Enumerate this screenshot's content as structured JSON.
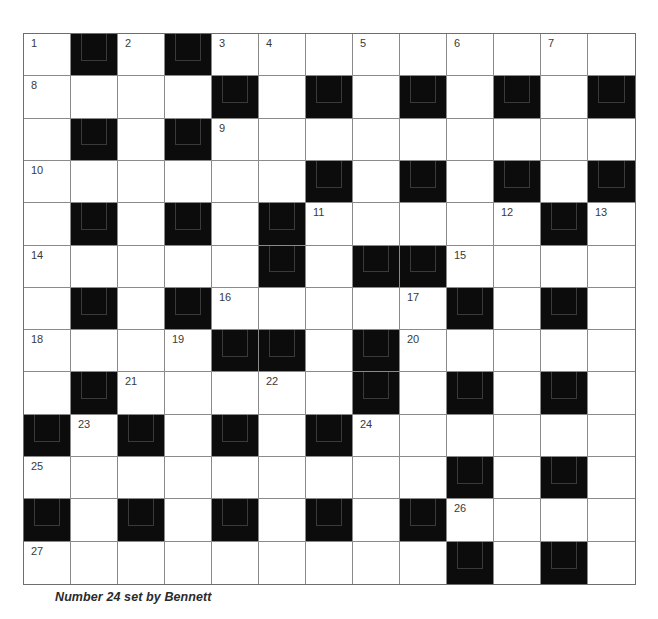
{
  "puzzle": {
    "caption": "Number 24 set by Bennett",
    "rows": 13,
    "cols": 13,
    "colors": {
      "block": "#0c0c0c",
      "cell": "#ffffff",
      "gridline": "#8a8a8a",
      "number": "#3a3a3a"
    },
    "layout": [
      "W.W.WWWWWWWWW",
      "WWWW.W.W.W.W.",
      "W.W.WWWWWWWWW",
      "WWWWWW.W.W.W.",
      "W.W.W.WWWWW.W",
      "WWWWW.W..WWWW",
      "W.W.WWWWW.W.W",
      "WWWW..W.WWWWW",
      "W.WWWWW.W.W.W",
      ".W.W.W.WWWWWW",
      "WWWWWWWWW.W.W",
      ".W.W.W.W.WWWW",
      "WWWWWWWWW.W.W"
    ],
    "numbers": [
      {
        "r": 0,
        "c": 0,
        "n": "1"
      },
      {
        "r": 0,
        "c": 2,
        "n": "2"
      },
      {
        "r": 0,
        "c": 4,
        "n": "3"
      },
      {
        "r": 0,
        "c": 5,
        "n": "4"
      },
      {
        "r": 0,
        "c": 7,
        "n": "5"
      },
      {
        "r": 0,
        "c": 9,
        "n": "6"
      },
      {
        "r": 0,
        "c": 11,
        "n": "7"
      },
      {
        "r": 1,
        "c": 0,
        "n": "8"
      },
      {
        "r": 2,
        "c": 4,
        "n": "9"
      },
      {
        "r": 3,
        "c": 0,
        "n": "10"
      },
      {
        "r": 4,
        "c": 6,
        "n": "11"
      },
      {
        "r": 4,
        "c": 10,
        "n": "12"
      },
      {
        "r": 4,
        "c": 12,
        "n": "13"
      },
      {
        "r": 5,
        "c": 0,
        "n": "14"
      },
      {
        "r": 5,
        "c": 9,
        "n": "15"
      },
      {
        "r": 6,
        "c": 4,
        "n": "16"
      },
      {
        "r": 6,
        "c": 8,
        "n": "17"
      },
      {
        "r": 7,
        "c": 0,
        "n": "18"
      },
      {
        "r": 7,
        "c": 3,
        "n": "19"
      },
      {
        "r": 7,
        "c": 8,
        "n": "20"
      },
      {
        "r": 8,
        "c": 2,
        "n": "21"
      },
      {
        "r": 8,
        "c": 5,
        "n": "22"
      },
      {
        "r": 9,
        "c": 1,
        "n": "23"
      },
      {
        "r": 9,
        "c": 7,
        "n": "24"
      },
      {
        "r": 10,
        "c": 0,
        "n": "25"
      },
      {
        "r": 11,
        "c": 9,
        "n": "26"
      },
      {
        "r": 12,
        "c": 0,
        "n": "27"
      }
    ],
    "entries": []
  }
}
